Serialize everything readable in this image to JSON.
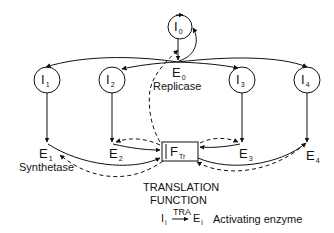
{
  "diagram": {
    "intermediates": [
      {
        "id": "I0",
        "base": "I",
        "sub": "0"
      },
      {
        "id": "I1",
        "base": "I",
        "sub": "1"
      },
      {
        "id": "I2",
        "base": "I",
        "sub": "2"
      },
      {
        "id": "I3",
        "base": "I",
        "sub": "3"
      },
      {
        "id": "I4",
        "base": "I",
        "sub": "4"
      }
    ],
    "enzymes": [
      {
        "id": "E0",
        "base": "E",
        "sub": "0",
        "role": "Replicase"
      },
      {
        "id": "E1",
        "base": "E",
        "sub": "1",
        "role": "Synthetase"
      },
      {
        "id": "E2",
        "base": "E",
        "sub": "2"
      },
      {
        "id": "E3",
        "base": "E",
        "sub": "3"
      },
      {
        "id": "E4",
        "base": "E",
        "sub": "4"
      }
    ],
    "translation_box": {
      "base": "F",
      "sub": "Tr"
    },
    "translation_caption": [
      "TRANSLATION",
      "FUNCTION"
    ],
    "legend": {
      "from": "I",
      "from_sub": "i",
      "arrow_label": "TRA",
      "to": "E",
      "to_sub": "i",
      "description": "Activating enzyme"
    },
    "line_color": "#111111",
    "background": "#ffffff"
  }
}
